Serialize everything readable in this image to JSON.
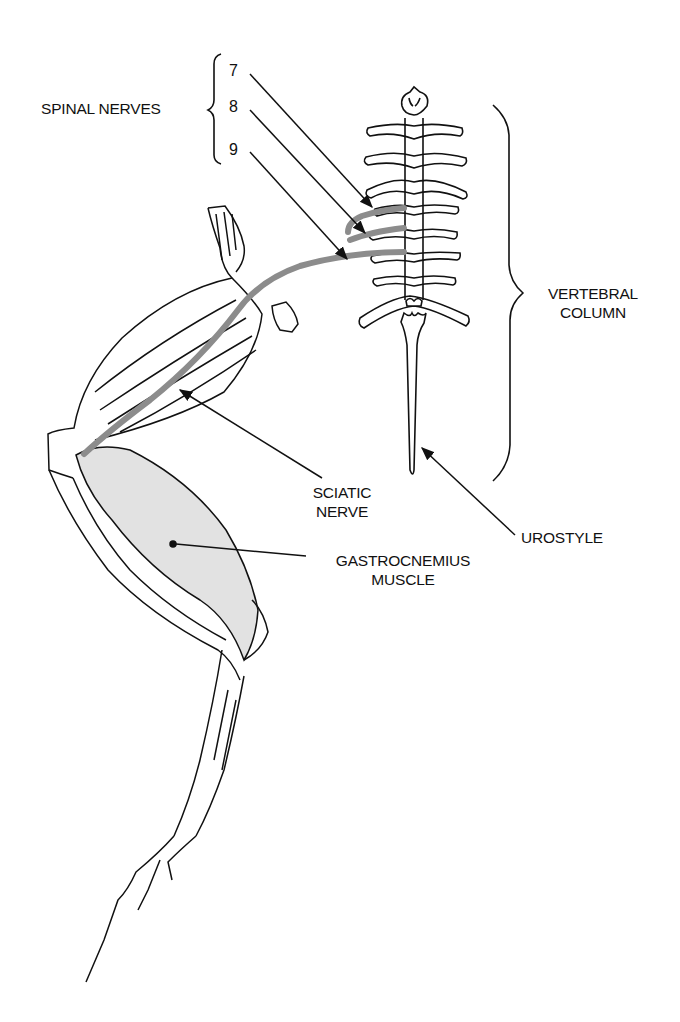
{
  "diagram": {
    "colors": {
      "line": "#111111",
      "nerve": "#8c8c8c",
      "muscle_shade": "#e2e2e2",
      "background": "#ffffff"
    },
    "labels": {
      "spinal_nerves": "SPINAL NERVES",
      "nerve_7": "7",
      "nerve_8": "8",
      "nerve_9": "9",
      "vertebral_column_line1": "VERTEBRAL",
      "vertebral_column_line2": "COLUMN",
      "sciatic_nerve_line1": "SCIATIC",
      "sciatic_nerve_line2": "NERVE",
      "urostyle": "UROSTYLE",
      "gastrocnemius_line1": "GASTROCNEMIUS",
      "gastrocnemius_line2": "MUSCLE"
    }
  }
}
